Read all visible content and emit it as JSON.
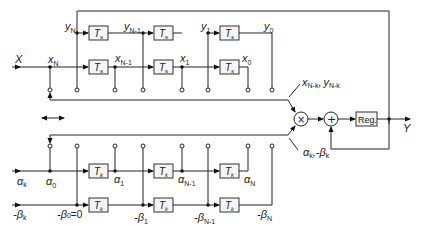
{
  "diagram": {
    "input_label": "X",
    "output_label": "Y",
    "delay_upper": {
      "symbol": "T",
      "sub": "s"
    },
    "delay_lower": {
      "symbol": "T",
      "sub": "k"
    },
    "register_label": "Reg.",
    "multiplier_symbol": "×",
    "adder_symbol": "+",
    "y_row": [
      {
        "base": "y",
        "sub": "N"
      },
      {
        "base": "y",
        "sub": "N-1"
      },
      {
        "base": "y",
        "sub": "1"
      },
      {
        "base": "y",
        "sub": "0"
      }
    ],
    "x_row": [
      {
        "base": "x",
        "sub": "N"
      },
      {
        "base": "x",
        "sub": "N-1"
      },
      {
        "base": "x",
        "sub": "1"
      },
      {
        "base": "x",
        "sub": "0"
      }
    ],
    "alpha_row": [
      {
        "base": "α",
        "sub": "k"
      },
      {
        "base": "α",
        "sub": "0"
      },
      {
        "base": "α",
        "sub": "1"
      },
      {
        "base": "α",
        "sub": "N-1"
      },
      {
        "base": "α",
        "sub": "N"
      }
    ],
    "beta_row": [
      {
        "base": "-β",
        "sub": "k"
      },
      {
        "base": "-β",
        "sub": "0",
        "suffix": "=0"
      },
      {
        "base": "-β",
        "sub": "1"
      },
      {
        "base": "-β",
        "sub": "N-1"
      },
      {
        "base": "-β",
        "sub": "N"
      }
    ],
    "mult_input_top": {
      "a": "x",
      "a_sub": "N-k",
      "b": "y",
      "b_sub": "N-k"
    },
    "mult_input_bottom": {
      "a": "α",
      "a_sub": "k",
      "b": "-β",
      "b_sub": "k"
    },
    "comma": ",",
    "shift_arrow": "↔"
  }
}
